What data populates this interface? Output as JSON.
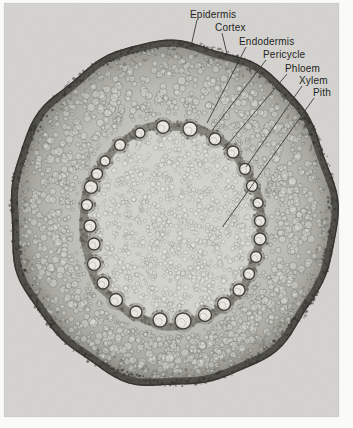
{
  "figure": {
    "photo_description": "Light micrograph of a dicot plant stem in transverse section showing concentric tissue layers and a ring of xylem vessels around a central pith"
  },
  "palette": {
    "page_bg": "#fafaf9",
    "photo_bg": "#d5d4d1",
    "label_text": "#1f1f1d",
    "leader_line": "#3b3a35",
    "outer_crust": "#45443f",
    "cortex_mid": "#bcbcb6",
    "stele_band": "#76756b",
    "vessel_fill": "#ebeae4",
    "pith_bg": "#d4d4cf"
  },
  "annotations": {
    "labels": [
      {
        "text": "Epidermis",
        "tx": 190,
        "ty": 18,
        "line": [
          197,
          20,
          191.5,
          44
        ]
      },
      {
        "text": "Cortex",
        "tx": 215,
        "ty": 31,
        "line": [
          222,
          33,
          227,
          54
        ]
      },
      {
        "text": "Endodermis",
        "tx": 239,
        "ty": 45,
        "line": [
          246,
          47,
          207,
          123
        ]
      },
      {
        "text": "Pericycle",
        "tx": 263,
        "ty": 58,
        "line": [
          266,
          60,
          212.5,
          130
        ]
      },
      {
        "text": "Phloem",
        "tx": 285,
        "ty": 72,
        "line": [
          287,
          74,
          223,
          150
        ]
      },
      {
        "text": "Xylem",
        "tx": 299,
        "ty": 84,
        "line": [
          302,
          86,
          246,
          167
        ]
      },
      {
        "text": "Pith",
        "tx": 313,
        "ty": 96,
        "line": [
          314,
          98,
          222.5,
          227
        ]
      }
    ]
  }
}
